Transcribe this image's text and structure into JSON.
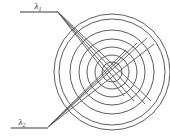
{
  "figure": {
    "background_color": "#ffffff",
    "width": 170,
    "height": 139,
    "line_color": "#4a4a4a",
    "ray_color": "#555555"
  },
  "labels": {
    "lambda1": {
      "symbol": "λ",
      "subscript": "1",
      "x": 38,
      "y": 11
    },
    "lambda2": {
      "symbol": "λ",
      "subscript": "2",
      "x": 22,
      "y": 126
    }
  },
  "sources": {
    "top": {
      "name": "source-lambda1",
      "vertex_x": 57,
      "vertex_y": 11,
      "baseline_x1": 20,
      "baseline_x2": 57,
      "baseline_y": 12
    },
    "bottom": {
      "name": "source-lambda2",
      "vertex_x": 48,
      "vertex_y": 127,
      "baseline_x1": 11,
      "baseline_x2": 48,
      "baseline_y": 128
    }
  },
  "rings": {
    "center_x": 112,
    "center_y": 72,
    "count": 6,
    "radii": [
      10,
      17,
      25,
      33,
      42,
      53,
      58
    ],
    "stroke_width": 0.9
  },
  "rays": {
    "top_endpoints": [
      {
        "x": 124,
        "y": 96
      },
      {
        "x": 134,
        "y": 101
      },
      {
        "x": 145,
        "y": 104
      },
      {
        "x": 151,
        "y": 101
      }
    ],
    "bottom_endpoints": [
      {
        "x": 126,
        "y": 50
      },
      {
        "x": 137,
        "y": 43
      },
      {
        "x": 147,
        "y": 38
      },
      {
        "x": 154,
        "y": 44
      }
    ]
  }
}
